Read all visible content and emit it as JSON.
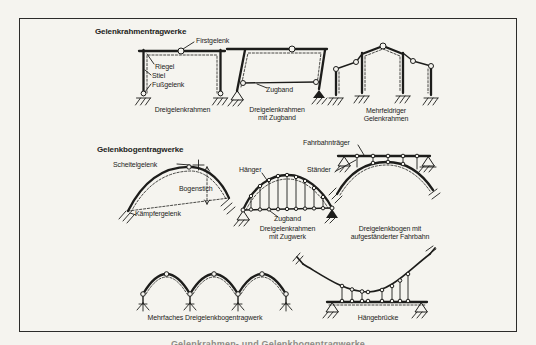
{
  "sections": {
    "frames_heading": "Gelenkrahmentragwerke",
    "arches_heading": "Gelenkbogentragwerke"
  },
  "diagrams": {
    "dreigelenkrahmen": {
      "caption": "Dreigelenkrahmen",
      "labels": {
        "firstgelenk": "Firstgelenk",
        "riegel": "Riegel",
        "stiel": "Stiel",
        "fussgelenk": "Fußgelenk"
      }
    },
    "rahmen_zugband": {
      "caption_line1": "Dreigelenkrahmen",
      "caption_line2": "mit Zugband",
      "labels": {
        "zugband": "Zugband"
      }
    },
    "mehrfeldrig": {
      "caption_line1": "Mehrfeldriger",
      "caption_line2": "Gelenkrahmen"
    },
    "bogen": {
      "labels": {
        "scheitelgelenk": "Scheitelgelenk",
        "bogenstich": "Bogenstich",
        "kaempfergelenk": "Kämpfergelenk"
      }
    },
    "bogen_zugwerk": {
      "caption_line1": "Dreigelenkrahmen",
      "caption_line2": "mit Zugwerk",
      "labels": {
        "haenger": "Hänger",
        "zugband": "Zugband"
      }
    },
    "bogen_fahrbahn": {
      "caption_line1": "Dreigelenkbogen mit",
      "caption_line2": "aufgeständerter Fahrbahn",
      "labels": {
        "fahrbahntraeger": "Fahrbahnträger",
        "staender": "Ständer"
      }
    },
    "mehrfach_bogen": {
      "caption": "Mehrfaches Dreigelenkbogentragwerk"
    },
    "haengebruecke": {
      "caption": "Hängebrücke"
    }
  },
  "footer": {
    "partial_caption": "Gelenkrahmen- und Gelenkbogentragwerke"
  },
  "colors": {
    "paper": "#f5f4ef",
    "ink": "#1d1d1b"
  }
}
